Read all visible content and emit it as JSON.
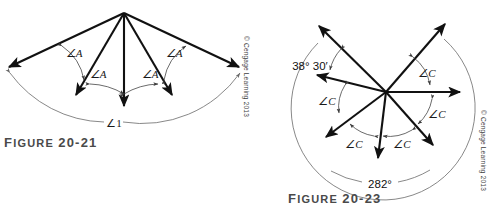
{
  "page": {
    "width": 501,
    "height": 209,
    "background": "#ffffff",
    "ink": "#111111",
    "thin_ink": "#6a6a6a",
    "caption_color": "#4a4a4a"
  },
  "figures": [
    {
      "id": "figure-20-21",
      "caption_lead": "F",
      "caption_rest": "IGURE ",
      "caption_number": "20-21",
      "caption_full": "FIGURE 20-21",
      "credit": "© Cengage Learning 2013",
      "vertex": {
        "x": 124,
        "y": 13
      },
      "angle_labels": [
        {
          "text": "∠A",
          "x": 74,
          "y": 57
        },
        {
          "text": "∠A",
          "x": 98,
          "y": 76
        },
        {
          "text": "∠A",
          "x": 135,
          "y": 76
        },
        {
          "text": "∠A",
          "x": 160,
          "y": 57
        }
      ],
      "total_angle_label": {
        "text": "∠1",
        "x": 113,
        "y": 127
      },
      "ray_count": 5,
      "rays": [
        {
          "name": "ray-far-left",
          "end_x": 6,
          "end_y": 69
        },
        {
          "name": "ray-left",
          "end_x": 74,
          "end_y": 98
        },
        {
          "name": "ray-center",
          "end_x": 124,
          "end_y": 109
        },
        {
          "name": "ray-right",
          "end_x": 174,
          "end_y": 98
        },
        {
          "name": "ray-far-right",
          "end_x": 243,
          "end_y": 69
        }
      ]
    },
    {
      "id": "figure-20-23",
      "caption_lead": "F",
      "caption_rest": "IGURE ",
      "caption_number": "20-23",
      "caption_full": "FIGURE 20-23",
      "credit": "© Cengage Learning 2013",
      "vertex": {
        "x": 386,
        "y": 92
      },
      "known_angle_label": {
        "text": "38° 30′",
        "x": 310,
        "y": 67
      },
      "total_angle_label": {
        "text": "282°",
        "x": 371,
        "y": 184
      },
      "angle_labels": [
        {
          "text": "∠C",
          "x": 424,
          "y": 73
        },
        {
          "text": "∠C",
          "x": 432,
          "y": 113
        },
        {
          "text": "∠C",
          "x": 400,
          "y": 143
        },
        {
          "text": "∠C",
          "x": 351,
          "y": 143
        },
        {
          "text": "∠C",
          "x": 325,
          "y": 110
        }
      ],
      "ray_count": 7,
      "rays": [
        {
          "name": "ray-upper-left",
          "end_x": 316,
          "end_y": 22
        },
        {
          "name": "ray-upper-right",
          "end_x": 448,
          "end_y": 20
        },
        {
          "name": "ray-left",
          "end_x": 313,
          "end_y": 74
        },
        {
          "name": "ray-right",
          "end_x": 464,
          "end_y": 92
        },
        {
          "name": "ray-lower-left",
          "end_x": 322,
          "end_y": 140
        },
        {
          "name": "ray-lower-right",
          "end_x": 437,
          "end_y": 148
        },
        {
          "name": "ray-down",
          "end_x": 378,
          "end_y": 161
        }
      ]
    }
  ]
}
